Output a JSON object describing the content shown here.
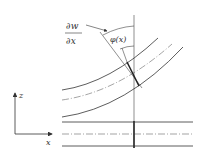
{
  "diagram": {
    "labels": {
      "dw": "∂w",
      "dx": "∂x",
      "phi": "φ(x)",
      "z_axis": "z",
      "x_axis": "x"
    },
    "colors": {
      "line": "#333333",
      "background": "#ffffff"
    }
  }
}
